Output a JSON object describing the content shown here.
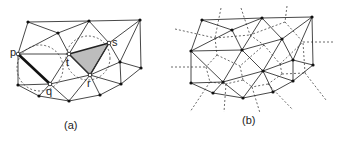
{
  "panels": [
    {
      "id": "a",
      "caption": "(a)",
      "vertex_labels": {
        "p": "p",
        "q": "q",
        "r": "r",
        "s": "s",
        "t": "t"
      },
      "description": "Delaunay triangulation with empty circumcircles; edge pq highlighted, triangle rst shaded"
    },
    {
      "id": "b",
      "caption": "(b)",
      "description": "Delaunay triangulation with dual Voronoi diagram (dashed)"
    }
  ],
  "colors": {
    "edge": "#333333",
    "shade": "#b8b8b8",
    "dashed": "#444444"
  }
}
